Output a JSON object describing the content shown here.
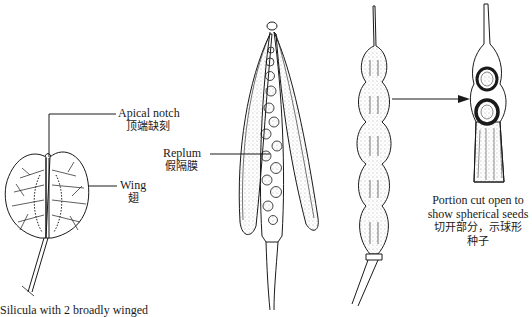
{
  "figure": {
    "subjects": [
      "silicula-broadly-winged",
      "siliqua-dehiscing-with-replum",
      "siliqua-moniliform",
      "siliqua-portion-cut-open"
    ]
  },
  "labels": {
    "apical_notch": {
      "en": "Apical notch",
      "zh": "顶端缺刻"
    },
    "wing": {
      "en": "Wing",
      "zh": "翅"
    },
    "replum": {
      "en": "Replum",
      "zh": "假隔膜"
    },
    "portion_cut": {
      "en_line1": "Portion cut open to",
      "en_line2": "show spherical seeds",
      "zh_line1": "切开部分，示球形",
      "zh_line2": "种子"
    },
    "silicula_caption": "Silicula with 2 broadly winged"
  },
  "colors": {
    "ink": "#1a1a1a",
    "background": "#ffffff"
  }
}
